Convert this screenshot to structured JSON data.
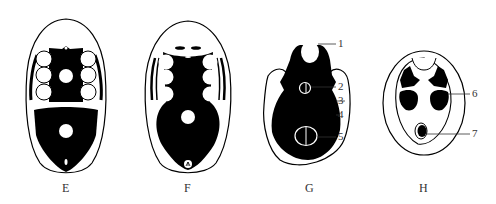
{
  "figure": {
    "panels": [
      {
        "id": "E",
        "label": "E"
      },
      {
        "id": "F",
        "label": "F"
      },
      {
        "id": "G",
        "label": "G"
      },
      {
        "id": "H",
        "label": "H"
      }
    ],
    "callouts": {
      "G": [
        "1",
        "2",
        "3",
        "4",
        "5"
      ],
      "H": [
        "6",
        "7"
      ]
    },
    "colors": {
      "ink": "#000000",
      "paper": "#ffffff",
      "text": "#333333"
    }
  }
}
